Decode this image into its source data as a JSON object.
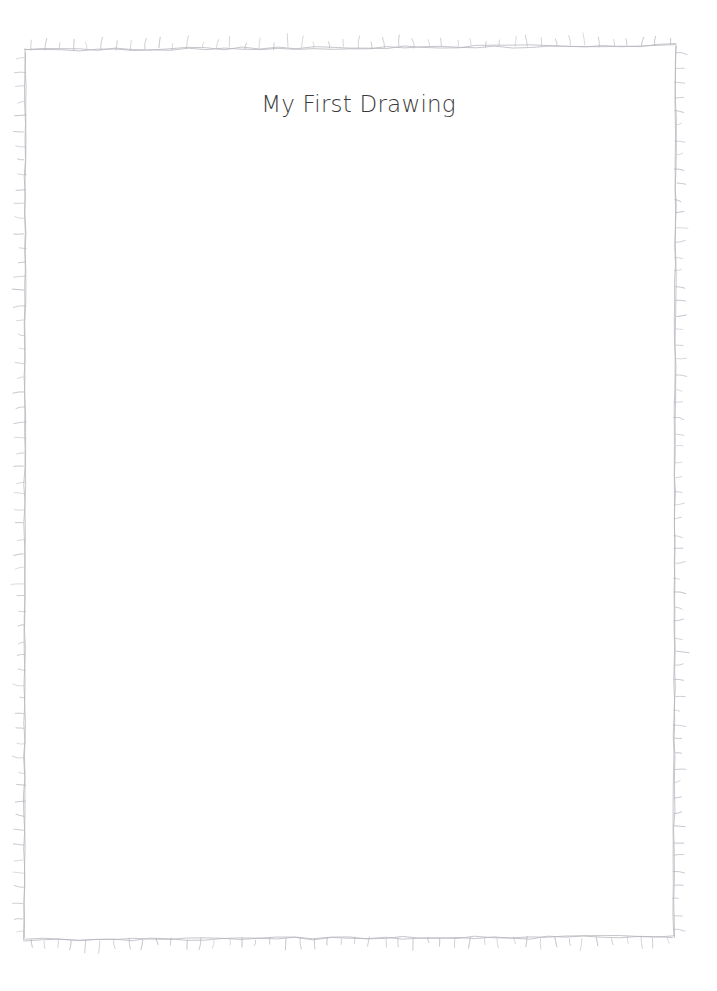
{
  "document": {
    "title": "My First Drawing"
  },
  "canvas": {
    "name": "drawing-canvas",
    "background_color": "#ffffff",
    "width": 717,
    "height": 991
  },
  "frame": {
    "name": "hand-drawn-rectangle-frame",
    "style": "sketchy",
    "stroke_color": "#b4b4bc",
    "stroke_width": 1,
    "tick_marks": {
      "present": true,
      "direction": "outward",
      "length": 9,
      "count_top": 45,
      "count_bottom": 45,
      "count_left": 60,
      "count_right": 60
    },
    "bounds": {
      "left": 25,
      "top": 48,
      "right": 675,
      "bottom": 939
    }
  },
  "title_element": {
    "name": "title-text",
    "text": "My First Drawing",
    "color": "#3a3a3a",
    "font_size": 23,
    "x_center": 352,
    "y_top": 94
  },
  "chart_data": {
    "type": "table",
    "title": "My First Drawing",
    "categories": [],
    "values": []
  }
}
